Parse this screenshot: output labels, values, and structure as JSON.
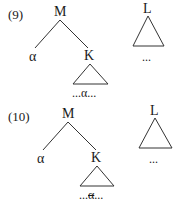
{
  "examples": [
    {
      "number": "(9)",
      "tree": {
        "root": "M",
        "left_child": "α",
        "right_child": "K",
        "k_subtree_yield_prefix": "...",
        "k_subtree_yield_alpha": "α",
        "k_subtree_yield_suffix": "...",
        "alpha_in_subtree_struck": false
      },
      "separate_tree": {
        "root": "L",
        "yield": "..."
      }
    },
    {
      "number": "(10)",
      "tree": {
        "root": "M",
        "left_child": "α",
        "right_child": "K",
        "k_subtree_yield_prefix": "...",
        "k_subtree_yield_alpha": "α",
        "k_subtree_yield_suffix": "...",
        "alpha_in_subtree_struck": true
      },
      "separate_tree": {
        "root": "L",
        "yield": "..."
      }
    }
  ],
  "colors": {
    "ink": "#1a1a1a",
    "background": "#ffffff"
  }
}
